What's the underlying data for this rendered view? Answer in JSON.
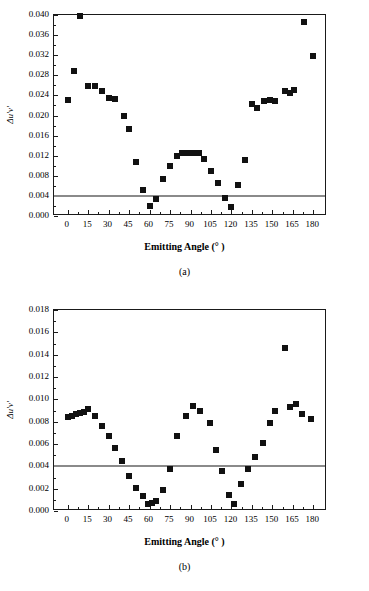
{
  "chart_data": [
    {
      "type": "scatter",
      "panel": "(a)",
      "title": "",
      "xlabel": "Emitting Angle (° )",
      "ylabel": "Δu'v'",
      "xlim": [
        -10,
        190
      ],
      "ylim": [
        0.0,
        0.04
      ],
      "xticks": [
        0,
        15,
        30,
        45,
        60,
        75,
        90,
        105,
        120,
        135,
        150,
        165,
        180
      ],
      "xticklabels": [
        "0",
        "15",
        "30",
        "45",
        "60",
        "75",
        "90",
        "105",
        "120",
        "135",
        "150",
        "165",
        "180"
      ],
      "yticks": [
        0.0,
        0.004,
        0.008,
        0.012,
        0.016,
        0.02,
        0.024,
        0.028,
        0.032,
        0.036,
        0.04
      ],
      "yticklabels": [
        "0.000",
        "0.004",
        "0.008",
        "0.012",
        "0.016",
        "0.020",
        "0.024",
        "0.028",
        "0.032",
        "0.036",
        "0.040"
      ],
      "grid": false,
      "legend": false,
      "reference_line": {
        "y": 0.004,
        "color": "#8a8a8a",
        "label": ""
      },
      "marker": {
        "shape": "square",
        "color": "#111111",
        "size": 6
      },
      "x": [
        0,
        5,
        9,
        15,
        20,
        25,
        30,
        35,
        41,
        45,
        50,
        55,
        60,
        65,
        70,
        75,
        80,
        84,
        87,
        90,
        93,
        96,
        100,
        105,
        110,
        115,
        120,
        125,
        130,
        135,
        139,
        144,
        148,
        152,
        159,
        163,
        166,
        173,
        180
      ],
      "y": [
        0.0231,
        0.0288,
        0.0399,
        0.0258,
        0.0258,
        0.0249,
        0.0235,
        0.0233,
        0.0199,
        0.0173,
        0.0107,
        0.0052,
        0.0019,
        0.0034,
        0.0073,
        0.0099,
        0.0119,
        0.0125,
        0.0126,
        0.0125,
        0.0125,
        0.0125,
        0.0114,
        0.0089,
        0.0066,
        0.0036,
        0.0018,
        0.0061,
        0.0111,
        0.0223,
        0.0214,
        0.0228,
        0.023,
        0.0228,
        0.0248,
        0.0244,
        0.0251,
        0.0387,
        0.0319
      ]
    },
    {
      "type": "scatter",
      "panel": "(b)",
      "title": "",
      "xlabel": "Emitting Angle (° )",
      "ylabel": "Δu'v'",
      "xlim": [
        -10,
        190
      ],
      "ylim": [
        0.0,
        0.018
      ],
      "xticks": [
        0,
        15,
        30,
        45,
        60,
        75,
        90,
        105,
        120,
        135,
        150,
        165,
        180
      ],
      "xticklabels": [
        "0",
        "15",
        "30",
        "45",
        "60",
        "75",
        "90",
        "105",
        "120",
        "135",
        "150",
        "165",
        "180"
      ],
      "yticks": [
        0.0,
        0.002,
        0.004,
        0.006,
        0.008,
        0.01,
        0.012,
        0.014,
        0.016,
        0.018
      ],
      "yticklabels": [
        "0.000",
        "0.002",
        "0.004",
        "0.006",
        "0.008",
        "0.010",
        "0.012",
        "0.014",
        "0.016",
        "0.018"
      ],
      "grid": false,
      "legend": false,
      "reference_line": {
        "y": 0.004,
        "color": "#8a8a8a",
        "label": ""
      },
      "marker": {
        "shape": "square",
        "color": "#111111",
        "size": 6
      },
      "x": [
        0,
        3,
        6,
        9,
        12,
        15,
        20,
        25,
        30,
        35,
        40,
        45,
        50,
        55,
        59,
        62,
        65,
        70,
        75,
        80,
        87,
        92,
        97,
        104,
        109,
        113,
        118,
        122,
        127,
        132,
        137,
        143,
        148,
        152,
        159,
        163,
        167,
        172,
        178
      ],
      "y": [
        0.0084,
        0.0085,
        0.0087,
        0.0088,
        0.0089,
        0.0091,
        0.0085,
        0.0076,
        0.0067,
        0.0056,
        0.0045,
        0.0031,
        0.0021,
        0.0013,
        0.0006,
        0.0007,
        0.0009,
        0.0019,
        0.0038,
        0.0067,
        0.0085,
        0.0094,
        0.009,
        0.0079,
        0.0055,
        0.0036,
        0.0014,
        0.0006,
        0.0024,
        0.0038,
        0.0048,
        0.0061,
        0.0079,
        0.009,
        0.0146,
        0.0093,
        0.0096,
        0.0087,
        0.0082
      ]
    }
  ],
  "panels": [
    {
      "caption": "(a)",
      "xlabel": "Emitting Angle (° )",
      "ylabel": "Δu'v'"
    },
    {
      "caption": "(b)",
      "xlabel": "Emitting Angle (° )",
      "ylabel": "Δu'v'"
    }
  ],
  "colors": {
    "marker": "#111111",
    "reference_line": "#8a8a8a",
    "axis": "#1a1a1a",
    "background": "#ffffff"
  }
}
